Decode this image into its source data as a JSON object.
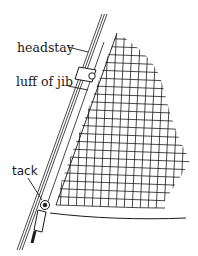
{
  "diagram": {
    "labels": {
      "headstay": "headstay",
      "luff": "luff of jib",
      "tack": "tack"
    },
    "components": [
      {
        "id": "headstay",
        "label": "headstay",
        "kind": "wire stay"
      },
      {
        "id": "luff",
        "label": "luff of jib",
        "kind": "sail edge"
      },
      {
        "id": "hank",
        "label": "",
        "kind": "hank/clip on headstay"
      },
      {
        "id": "tack",
        "label": "tack",
        "kind": "shackle at sail corner"
      },
      {
        "id": "sail",
        "label": "",
        "kind": "jib sail (crosshatched)"
      },
      {
        "id": "foot",
        "label": "",
        "kind": "foot of sail"
      }
    ],
    "colors": {
      "ink": "#1a1a1a",
      "background": "#ffffff"
    }
  }
}
